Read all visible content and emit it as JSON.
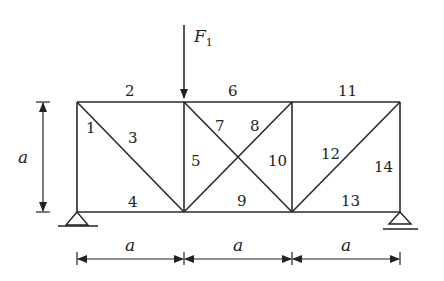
{
  "diagram": {
    "type": "truss",
    "load": {
      "label": "F",
      "subscript": "1",
      "node": "top-2"
    },
    "dimension_label": "a",
    "members": [
      {
        "id": "1",
        "label": "1"
      },
      {
        "id": "2",
        "label": "2"
      },
      {
        "id": "3",
        "label": "3"
      },
      {
        "id": "4",
        "label": "4"
      },
      {
        "id": "5",
        "label": "5"
      },
      {
        "id": "6",
        "label": "6"
      },
      {
        "id": "7",
        "label": "7"
      },
      {
        "id": "8",
        "label": "8"
      },
      {
        "id": "9",
        "label": "9"
      },
      {
        "id": "10",
        "label": "10"
      },
      {
        "id": "11",
        "label": "11"
      },
      {
        "id": "12",
        "label": "12"
      },
      {
        "id": "13",
        "label": "13"
      },
      {
        "id": "14",
        "label": "14"
      }
    ],
    "dimensions": {
      "height": "a",
      "spans": [
        "a",
        "a",
        "a"
      ]
    },
    "supports": [
      "pin-left",
      "roller-right"
    ]
  }
}
